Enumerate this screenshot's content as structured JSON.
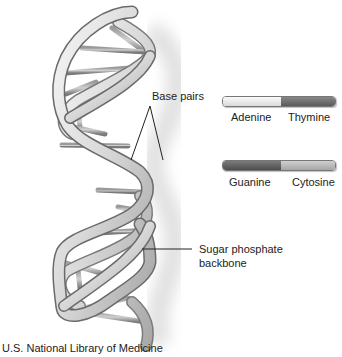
{
  "labels": {
    "base_pairs": "Base pairs",
    "sugar_phosphate_line1": "Sugar phosphate",
    "sugar_phosphate_line2": "backbone"
  },
  "legend": [
    {
      "left": "Adenine",
      "right": "Thymine",
      "left_color": "#e6e6e6",
      "right_color": "#6e6e6e"
    },
    {
      "left": "Guanine",
      "right": "Cytosine",
      "left_color": "#5e5e5e",
      "right_color": "#b4b4b4"
    }
  ],
  "credit": "U.S. National Library of Medicine",
  "colors": {
    "ribbon_light": "#e8e8e8",
    "ribbon_dark": "#9a9a9a",
    "ribbon_edge": "#6a6a6a",
    "rung_light": "#cfcfcf",
    "rung_dark": "#5a5a5a",
    "shadow": "#d0d0d0"
  }
}
